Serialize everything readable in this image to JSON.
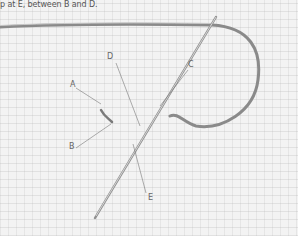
{
  "caption": "p at E, between B and D.",
  "labels": [
    {
      "id": "A",
      "text": "A",
      "x": 70,
      "y": 80
    },
    {
      "id": "B",
      "text": "B",
      "x": 69,
      "y": 142
    },
    {
      "id": "C",
      "text": "C",
      "x": 188,
      "y": 60
    },
    {
      "id": "D",
      "text": "D",
      "x": 107,
      "y": 52
    },
    {
      "id": "E",
      "text": "E",
      "x": 148,
      "y": 193
    }
  ],
  "colors": {
    "fabric": "#f3f3f3",
    "thread": "#8a8a8a",
    "needle": "#9a9a9a",
    "leader": "#777777"
  }
}
